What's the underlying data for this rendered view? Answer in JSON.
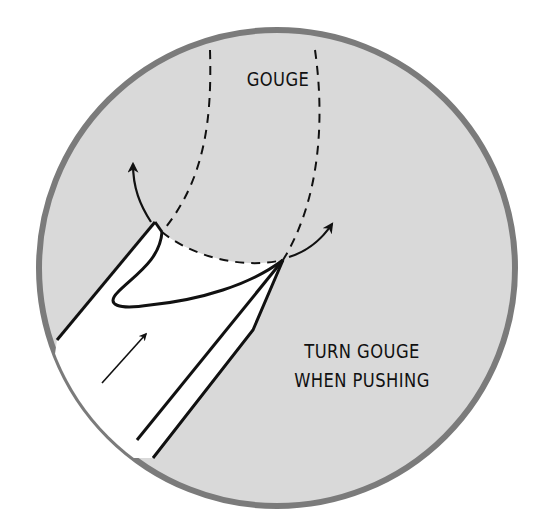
{
  "diagram": {
    "type": "technique-illustration",
    "labels": {
      "gouge": "GOUGE",
      "instruction_line1": "TURN GOUGE",
      "instruction_line2": "WHEN PUSHING"
    },
    "elements": [
      {
        "name": "circle-frame",
        "shape": "circle",
        "center": [
          277,
          268
        ],
        "radius": 240
      },
      {
        "name": "gouge-path-dashed",
        "style": "dashed",
        "description": "U-shaped outline of the gouge cut path"
      },
      {
        "name": "tool-blade",
        "description": "gouge tool entering from lower-left, tip at the cut"
      },
      {
        "name": "push-direction-arrow",
        "direction": "up-right"
      },
      {
        "name": "left-turn-arrow",
        "direction": "up-left"
      },
      {
        "name": "right-turn-arrow",
        "direction": "up-right"
      }
    ],
    "colors": {
      "circle_fill": "#d9d9d9",
      "circle_border": "#7b7b7b",
      "ink": "#111111",
      "tool_fill": "#ffffff",
      "background": "#ffffff"
    }
  }
}
